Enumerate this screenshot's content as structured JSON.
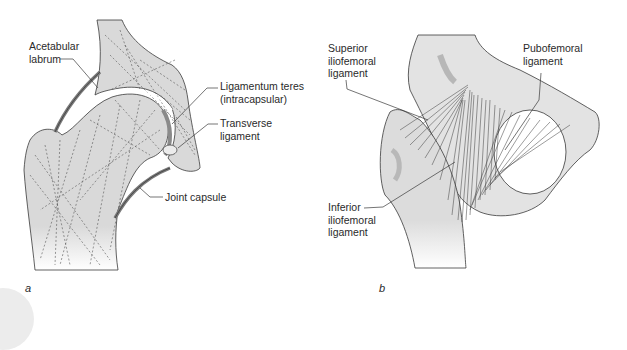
{
  "figure": {
    "panels": [
      {
        "id": "a",
        "panel_label": "a",
        "description": "Coronal section of hip joint",
        "labels": [
          {
            "key": "acetabular_labrum",
            "text": "Acetabular\nlabrum"
          },
          {
            "key": "ligamentum_teres",
            "text": "Ligamentum teres\n(intracapsular)"
          },
          {
            "key": "transverse_ligament",
            "text": "Transverse\nligament"
          },
          {
            "key": "joint_capsule",
            "text": "Joint capsule"
          }
        ]
      },
      {
        "id": "b",
        "panel_label": "b",
        "description": "Anterior view of hip ligaments",
        "labels": [
          {
            "key": "superior_iliofemoral",
            "text": "Superior\niliofemoral\nligament"
          },
          {
            "key": "pubofemoral",
            "text": "Pubofemoral\nligament"
          },
          {
            "key": "inferior_iliofemoral",
            "text": "Inferior\niliofemoral\nligament"
          }
        ]
      }
    ]
  },
  "colors": {
    "bone_fill": "#d9d9d9",
    "bone_light": "#e6e6e6",
    "outline": "#3a3a3a",
    "shadow": "#a8a8a8",
    "text": "#2a2a2a"
  }
}
